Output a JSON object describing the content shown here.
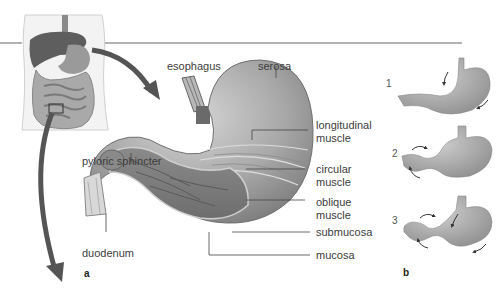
{
  "figure": {
    "panel_a": {
      "letter": "a",
      "labels": {
        "esophagus": "esophagus",
        "serosa": "serosa",
        "longitudinal_muscle": [
          "longitudinal",
          "muscle"
        ],
        "circular_muscle": [
          "circular",
          "muscle"
        ],
        "oblique_muscle": [
          "oblique",
          "muscle"
        ],
        "submucosa": "submucosa",
        "mucosa": "mucosa",
        "pyloric_sphincter": "pyloric sphincter",
        "duodenum": "duodenum"
      }
    },
    "panel_b": {
      "letter": "b",
      "steps": [
        "1",
        "2",
        "3"
      ]
    },
    "colors": {
      "stomach_gray": "#9a9a9a",
      "stomach_light": "#c8c8c8",
      "arrow_dark": "#555555",
      "rule_line": "#666666"
    }
  }
}
